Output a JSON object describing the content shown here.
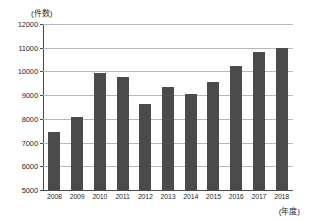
{
  "chart_data": {
    "type": "bar",
    "title": "",
    "xlabel": "(年度)",
    "ylabel": "(件数)",
    "categories": [
      "2008",
      "2009",
      "2010",
      "2011",
      "2012",
      "2013",
      "2014",
      "2015",
      "2016",
      "2017",
      "2018"
    ],
    "values": [
      7450,
      8100,
      9950,
      9760,
      8620,
      9340,
      9050,
      9560,
      10250,
      10800,
      11000
    ],
    "ylim": [
      5000,
      12000
    ],
    "y_ticks": [
      5000,
      6000,
      7000,
      8000,
      9000,
      10000,
      11000,
      12000
    ],
    "y_tick_labels": [
      "5000",
      "6000",
      "7000",
      "8000",
      "9000",
      "10000",
      "11000",
      "12000"
    ],
    "grid": true,
    "legend": false,
    "bar_color": "#4b4b4b",
    "gridline_color": "#b9b9b9",
    "axis_color": "#4a4a4a",
    "background_color": "#ffffff"
  },
  "axes": {
    "y_unit_label": "(件数)",
    "x_unit_label": "(年度)"
  }
}
